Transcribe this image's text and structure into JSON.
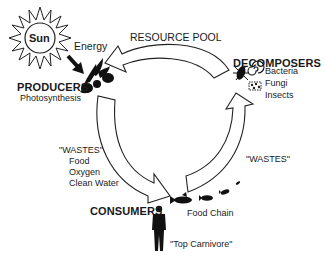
{
  "diagram": {
    "sun": {
      "label": "Sun",
      "icon": "sun-icon"
    },
    "energy": {
      "label": "Energy",
      "icon": "arrow-down-right-icon"
    },
    "producers": {
      "heading": "PRODUCERS",
      "subtitle": "Photosynthesis",
      "icon": "plant-icon"
    },
    "resource_pool": {
      "label": "RESOURCE POOL"
    },
    "decomposers": {
      "heading": "DECOMPOSERS",
      "items": [
        "Bacteria",
        "Fungi",
        "Insects"
      ],
      "icons": [
        "bacteria-icon",
        "spiral-icon",
        "fungi-icon"
      ]
    },
    "producer_wastes": {
      "heading": "\"WASTES\"",
      "items": [
        "Food",
        "Oxygen",
        "Clean Water"
      ]
    },
    "consumer_wastes": {
      "label": "\"WASTES\""
    },
    "consumers": {
      "heading": "CONSUMERS",
      "food_chain": "Food Chain",
      "top": "\"Top Carnivore\"",
      "icons": [
        "human-icon",
        "fish-large-icon",
        "fish-medium-icon",
        "fish-small-icon",
        "fish-tiny-icon"
      ]
    },
    "colors": {
      "line": "#222222",
      "fill": "#ffffff",
      "silhouette": "#111111"
    }
  }
}
